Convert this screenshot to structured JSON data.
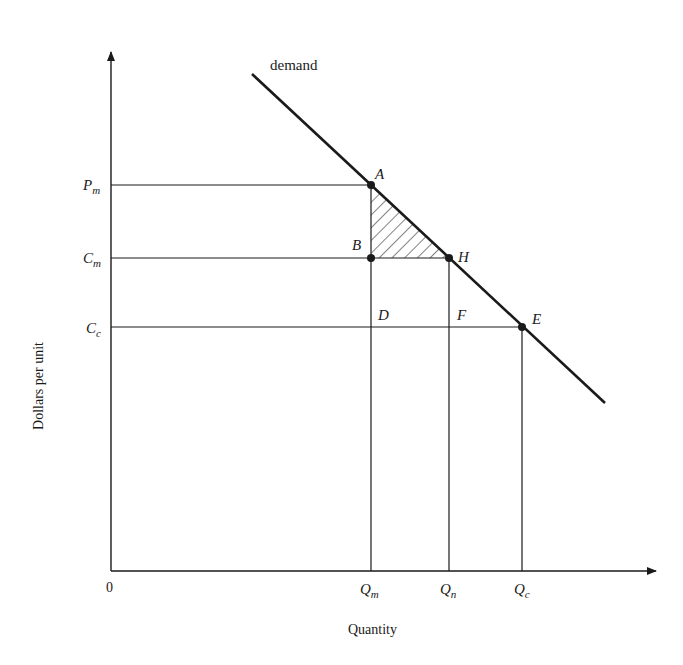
{
  "diagram": {
    "type": "economics-monopoly-deadweight-loss",
    "axes": {
      "x_label": "Quantity",
      "y_label": "Dollars per unit",
      "origin_label": "0"
    },
    "curve": {
      "label": "demand"
    },
    "y_ticks": [
      {
        "id": "Pm",
        "main": "P",
        "sub": "m"
      },
      {
        "id": "Cm",
        "main": "C",
        "sub": "m"
      },
      {
        "id": "Cc",
        "main": "C",
        "sub": "c"
      }
    ],
    "x_ticks": [
      {
        "id": "Qm",
        "main": "Q",
        "sub": "m"
      },
      {
        "id": "Qn",
        "main": "Q",
        "sub": "n"
      },
      {
        "id": "Qc",
        "main": "Q",
        "sub": "c"
      }
    ],
    "points": {
      "A": "A",
      "B": "B",
      "H": "H",
      "D": "D",
      "F": "F",
      "E": "E"
    },
    "shaded_region": "triangle ABH (hatched)",
    "colors": {
      "ink": "#1a1a1a",
      "background": "#ffffff"
    }
  }
}
